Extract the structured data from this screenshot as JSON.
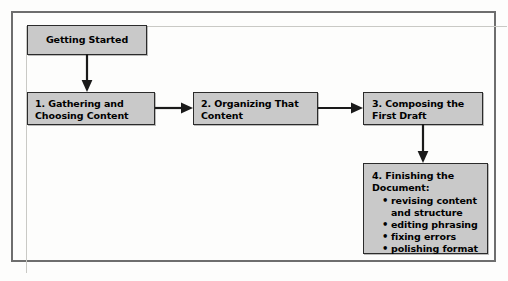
{
  "diagram": {
    "colors": {
      "node_fill": "#c9c9c9",
      "node_border": "#2b2b2b",
      "arrow": "#1a1a1a",
      "frame_border": "#6e6e6e",
      "background": "#fdfdfc"
    },
    "nodes": [
      {
        "id": "start",
        "label": "Getting Started"
      },
      {
        "id": "step-1",
        "label": "1. Gathering and\n     Choosing Content"
      },
      {
        "id": "step-2",
        "label": "2. Organizing That\n     Content"
      },
      {
        "id": "step-3",
        "label": "3. Composing the\n     First Draft"
      },
      {
        "id": "step-4",
        "heading": "4. Finishing the\n     Document:",
        "bullets": [
          "revising content\nand structure",
          "editing phrasing",
          "fixing errors",
          "polishing format"
        ]
      }
    ],
    "arrows": [
      {
        "id": "start-to-1",
        "direction": "down"
      },
      {
        "id": "step1-to-step2",
        "direction": "right"
      },
      {
        "id": "step2-to-step3",
        "direction": "right"
      },
      {
        "id": "step3-to-step4",
        "direction": "down"
      }
    ]
  }
}
